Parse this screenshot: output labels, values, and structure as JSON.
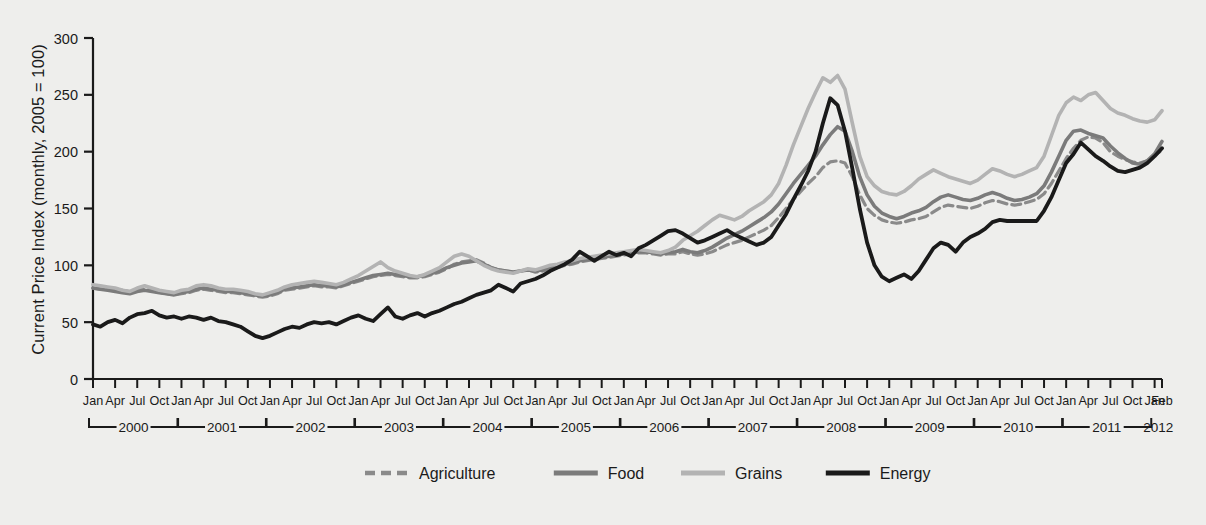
{
  "chart_data": {
    "type": "line",
    "title": "",
    "xlabel": "",
    "ylabel": "Current Price Index (monthly, 2005 = 100)",
    "ylim": [
      0,
      300
    ],
    "yticks": [
      0,
      50,
      100,
      150,
      200,
      250,
      300
    ],
    "grid": false,
    "legend_position": "bottom",
    "x_tick_labels": [
      "Jan",
      "Apr",
      "Jul",
      "Oct",
      "Jan",
      "Apr",
      "Jul",
      "Oct",
      "Jan",
      "Apr",
      "Jul",
      "Oct",
      "Jan",
      "Apr",
      "Jul",
      "Oct",
      "Jan",
      "Apr",
      "Jul",
      "Oct",
      "Jan",
      "Apr",
      "Jul",
      "Oct",
      "Jan",
      "Apr",
      "Jul",
      "Oct",
      "Jan",
      "Apr",
      "Jul",
      "Oct",
      "Jan",
      "Apr",
      "Jul",
      "Oct",
      "Jan",
      "Apr",
      "Jul",
      "Oct",
      "Jan",
      "Apr",
      "Jul",
      "Oct",
      "Jan",
      "Apr",
      "Jul",
      "Oct",
      "Jan",
      "Feb"
    ],
    "year_groups": [
      {
        "label": "2000",
        "start_month": 0,
        "end_month": 11,
        "bracket": true
      },
      {
        "label": "2001",
        "start_month": 12,
        "end_month": 23,
        "bracket": true
      },
      {
        "label": "2002",
        "start_month": 24,
        "end_month": 35,
        "bracket": true
      },
      {
        "label": "2003",
        "start_month": 36,
        "end_month": 47,
        "bracket": true
      },
      {
        "label": "2004",
        "start_month": 48,
        "end_month": 59,
        "bracket": true
      },
      {
        "label": "2005",
        "start_month": 60,
        "end_month": 71,
        "bracket": true
      },
      {
        "label": "2006",
        "start_month": 72,
        "end_month": 83,
        "bracket": true
      },
      {
        "label": "2007",
        "start_month": 84,
        "end_month": 95,
        "bracket": true
      },
      {
        "label": "2008",
        "start_month": 96,
        "end_month": 107,
        "bracket": true
      },
      {
        "label": "2009",
        "start_month": 108,
        "end_month": 119,
        "bracket": true
      },
      {
        "label": "2010",
        "start_month": 120,
        "end_month": 131,
        "bracket": true
      },
      {
        "label": "2011",
        "start_month": 132,
        "end_month": 143,
        "bracket": true
      },
      {
        "label": "2012",
        "start_month": 144,
        "end_month": 145,
        "bracket": false
      }
    ],
    "x_start": "Jan 2000",
    "x_end": "Feb 2012",
    "n_points": 146,
    "series": [
      {
        "name": "Agriculture",
        "color": "#8a8a8a",
        "style": "dashed",
        "width": 3.2,
        "values": [
          80,
          79,
          79,
          79,
          78,
          77,
          79,
          79,
          78,
          76,
          75,
          74,
          75,
          76,
          78,
          79,
          78,
          77,
          76,
          76,
          75,
          74,
          73,
          72,
          73,
          75,
          78,
          79,
          80,
          81,
          82,
          81,
          81,
          80,
          82,
          84,
          86,
          88,
          90,
          91,
          92,
          91,
          90,
          89,
          89,
          90,
          92,
          94,
          97,
          101,
          103,
          104,
          105,
          102,
          98,
          96,
          95,
          94,
          95,
          96,
          94,
          95,
          97,
          98,
          100,
          101,
          103,
          104,
          105,
          106,
          107,
          108,
          109,
          110,
          111,
          111,
          110,
          109,
          110,
          110,
          112,
          110,
          109,
          110,
          112,
          115,
          118,
          120,
          122,
          125,
          128,
          131,
          135,
          142,
          150,
          158,
          165,
          172,
          178,
          186,
          191,
          192,
          190,
          178,
          162,
          150,
          144,
          140,
          138,
          137,
          138,
          140,
          141,
          143,
          147,
          151,
          153,
          152,
          151,
          150,
          152,
          155,
          157,
          156,
          154,
          153,
          154,
          156,
          158,
          163,
          172,
          183,
          194,
          203,
          210,
          213,
          212,
          208,
          200,
          196,
          193,
          191,
          190,
          192,
          197,
          201
        ]
      },
      {
        "name": "Food",
        "color": "#7b7b7b",
        "style": "solid",
        "width": 3.6,
        "values": [
          80,
          79,
          78,
          77,
          76,
          75,
          77,
          78,
          77,
          76,
          75,
          74,
          76,
          77,
          79,
          80,
          79,
          78,
          77,
          77,
          76,
          75,
          74,
          73,
          74,
          76,
          79,
          80,
          81,
          82,
          83,
          82,
          82,
          81,
          83,
          85,
          87,
          89,
          91,
          92,
          93,
          92,
          91,
          90,
          90,
          91,
          93,
          95,
          98,
          100,
          102,
          103,
          104,
          101,
          98,
          96,
          95,
          94,
          95,
          96,
          95,
          96,
          98,
          99,
          101,
          102,
          104,
          105,
          106,
          107,
          108,
          109,
          110,
          111,
          112,
          112,
          111,
          110,
          111,
          112,
          114,
          112,
          111,
          113,
          116,
          120,
          124,
          127,
          130,
          134,
          138,
          142,
          147,
          154,
          163,
          172,
          180,
          188,
          196,
          206,
          215,
          222,
          218,
          200,
          178,
          162,
          152,
          146,
          143,
          141,
          143,
          146,
          148,
          151,
          156,
          160,
          162,
          160,
          158,
          157,
          159,
          162,
          164,
          162,
          159,
          157,
          158,
          160,
          163,
          170,
          182,
          196,
          210,
          218,
          219,
          216,
          214,
          212,
          205,
          199,
          194,
          190,
          189,
          192,
          198,
          209
        ]
      },
      {
        "name": "Grains",
        "color": "#b3b3b3",
        "style": "solid",
        "width": 3.6,
        "values": [
          83,
          82,
          81,
          80,
          78,
          77,
          80,
          82,
          80,
          78,
          77,
          76,
          78,
          79,
          82,
          83,
          82,
          80,
          79,
          79,
          78,
          77,
          75,
          74,
          76,
          78,
          81,
          83,
          84,
          85,
          86,
          85,
          84,
          83,
          85,
          88,
          91,
          95,
          99,
          103,
          98,
          95,
          93,
          91,
          90,
          92,
          95,
          98,
          103,
          108,
          110,
          108,
          104,
          100,
          97,
          95,
          94,
          93,
          95,
          97,
          96,
          98,
          100,
          101,
          103,
          104,
          106,
          107,
          108,
          109,
          110,
          111,
          112,
          113,
          114,
          113,
          112,
          111,
          113,
          116,
          122,
          126,
          130,
          135,
          140,
          144,
          142,
          140,
          143,
          148,
          152,
          156,
          162,
          172,
          188,
          206,
          222,
          238,
          252,
          265,
          261,
          267,
          255,
          225,
          196,
          178,
          170,
          165,
          163,
          162,
          165,
          170,
          176,
          180,
          184,
          181,
          178,
          176,
          174,
          172,
          175,
          180,
          185,
          183,
          180,
          178,
          180,
          183,
          186,
          196,
          214,
          232,
          243,
          248,
          245,
          250,
          252,
          245,
          238,
          234,
          232,
          229,
          227,
          226,
          228,
          236
        ]
      },
      {
        "name": "Energy",
        "color": "#1a1a1a",
        "style": "solid",
        "width": 3.8,
        "values": [
          48,
          46,
          50,
          52,
          49,
          54,
          57,
          58,
          60,
          56,
          54,
          55,
          53,
          55,
          54,
          52,
          54,
          51,
          50,
          48,
          46,
          42,
          38,
          36,
          38,
          41,
          44,
          46,
          45,
          48,
          50,
          49,
          50,
          48,
          51,
          54,
          56,
          53,
          51,
          57,
          63,
          55,
          53,
          56,
          58,
          55,
          58,
          60,
          63,
          66,
          68,
          71,
          74,
          76,
          78,
          83,
          80,
          77,
          84,
          86,
          88,
          91,
          95,
          98,
          101,
          105,
          112,
          108,
          104,
          108,
          112,
          109,
          111,
          108,
          115,
          118,
          122,
          126,
          130,
          131,
          128,
          124,
          120,
          122,
          125,
          128,
          131,
          127,
          124,
          121,
          118,
          120,
          125,
          135,
          145,
          158,
          170,
          183,
          200,
          225,
          247,
          241,
          218,
          185,
          150,
          120,
          100,
          90,
          86,
          89,
          92,
          88,
          95,
          105,
          115,
          120,
          118,
          112,
          120,
          125,
          128,
          132,
          138,
          140,
          139,
          139,
          139,
          139,
          139,
          148,
          160,
          175,
          190,
          198,
          208,
          202,
          196,
          192,
          187,
          183,
          182,
          184,
          186,
          190,
          196,
          203
        ]
      }
    ]
  },
  "legend": {
    "items": [
      {
        "label": "Agriculture"
      },
      {
        "label": "Food"
      },
      {
        "label": "Grains"
      },
      {
        "label": "Energy"
      }
    ]
  },
  "axis": {
    "y_title": "Current Price Index (monthly, 2005 = 100)"
  },
  "colors": {
    "background": "#eeeeec",
    "axis": "#1a1a1a",
    "agriculture": "#8a8a8a",
    "food": "#7b7b7b",
    "grains": "#b3b3b3",
    "energy": "#1a1a1a"
  }
}
